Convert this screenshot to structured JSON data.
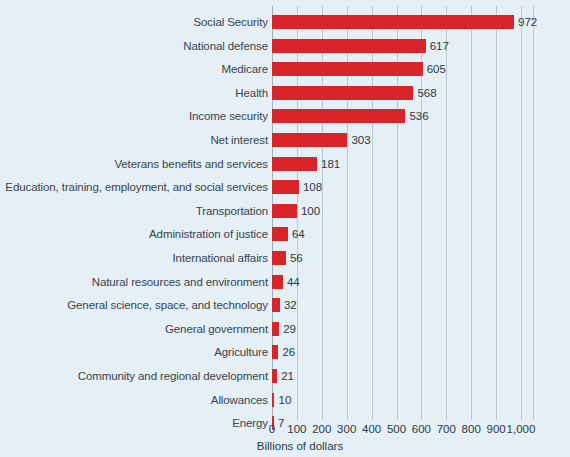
{
  "chart_data": {
    "type": "bar",
    "orientation": "horizontal",
    "title": "",
    "xlabel": "Billions of dollars",
    "ylabel": "",
    "xlim": [
      0,
      1000
    ],
    "grid": true,
    "legend": false,
    "accent_color": "#d9242a",
    "background_color": "#e4eff6",
    "xticks": [
      0,
      100,
      200,
      300,
      400,
      500,
      600,
      700,
      800,
      900,
      1000
    ],
    "xtick_labels": [
      "0",
      "100",
      "200",
      "300",
      "400",
      "500",
      "600",
      "700",
      "800",
      "900",
      "1,000"
    ],
    "categories": [
      "Social Security",
      "National defense",
      "Medicare",
      "Health",
      "Income security",
      "Net interest",
      "Veterans benefits and services",
      "Education, training, employment, and social services",
      "Transportation",
      "Administration of justice",
      "International affairs",
      "Natural resources and environment",
      "General science, space, and technology",
      "General government",
      "Agriculture",
      "Community and regional development",
      "Allowances",
      "Energy"
    ],
    "values": [
      972,
      617,
      605,
      568,
      536,
      303,
      181,
      108,
      100,
      64,
      56,
      44,
      32,
      29,
      26,
      21,
      10,
      7
    ],
    "value_labels": [
      "972",
      "617",
      "605",
      "568",
      "536",
      "303",
      "181",
      "108",
      "100",
      "64",
      "56",
      "44",
      "32",
      "29",
      "26",
      "21",
      "10",
      "7"
    ]
  }
}
